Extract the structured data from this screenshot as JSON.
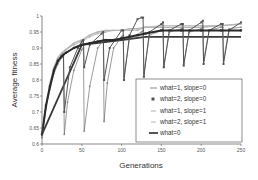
{
  "chart_data": {
    "type": "line",
    "title": "",
    "xlabel": "Generations",
    "ylabel": "Average fitness",
    "xlim": [
      0,
      250
    ],
    "ylim": [
      0.6,
      1.0
    ],
    "xticks": [
      0,
      50,
      100,
      150,
      200,
      250
    ],
    "xtick_labels": [
      "0",
      "50",
      "100",
      "150",
      "200",
      "250"
    ],
    "yticks": [
      0.6,
      0.65,
      0.7,
      0.75,
      0.8,
      0.85,
      0.9,
      0.95,
      1.0
    ],
    "ytick_labels": [
      "0.6",
      "0.65",
      "0.7",
      "0.75",
      "0.8",
      "0.85",
      "0.9",
      "0.95",
      "1"
    ],
    "grid": false,
    "legend_position": "lower right",
    "series": [
      {
        "name": "what=1, slope=0",
        "color": "#6e6e6e",
        "marker": "plus",
        "x": [
          0,
          5,
          10,
          15,
          20,
          25,
          27,
          28,
          32,
          40,
          50,
          52,
          53,
          60,
          70,
          77,
          78,
          82,
          90,
          100,
          102,
          103,
          110,
          125,
          127,
          128,
          135,
          150,
          152,
          153,
          160,
          175,
          177,
          178,
          185,
          200,
          202,
          203,
          210,
          225,
          227,
          228,
          235,
          250
        ],
        "y": [
          0.62,
          0.71,
          0.77,
          0.82,
          0.85,
          0.87,
          0.875,
          0.63,
          0.73,
          0.83,
          0.895,
          0.9,
          0.64,
          0.78,
          0.9,
          0.925,
          0.67,
          0.79,
          0.9,
          0.935,
          0.94,
          0.81,
          0.93,
          0.95,
          0.955,
          0.82,
          0.94,
          0.955,
          0.96,
          0.84,
          0.95,
          0.96,
          0.96,
          0.85,
          0.95,
          0.96,
          0.965,
          0.86,
          0.955,
          0.965,
          0.965,
          0.86,
          0.96,
          0.965
        ]
      },
      {
        "name": "what=2, slope=0",
        "color": "#555555",
        "marker": "square",
        "x": [
          0,
          5,
          10,
          15,
          20,
          25,
          27,
          28,
          35,
          45,
          50,
          52,
          53,
          60,
          75,
          77,
          78,
          85,
          100,
          102,
          103,
          110,
          120,
          125,
          127,
          128,
          135,
          150,
          152,
          153,
          160,
          175,
          177,
          178,
          185,
          200,
          202,
          203,
          210,
          225,
          227,
          228,
          235,
          250
        ],
        "y": [
          0.63,
          0.72,
          0.78,
          0.83,
          0.86,
          0.875,
          0.88,
          0.7,
          0.84,
          0.9,
          0.92,
          0.925,
          0.84,
          0.91,
          0.945,
          0.95,
          0.8,
          0.9,
          0.955,
          0.955,
          0.8,
          0.94,
          0.99,
          0.995,
          0.995,
          0.81,
          0.95,
          0.975,
          0.98,
          0.84,
          0.955,
          0.975,
          0.975,
          0.845,
          0.955,
          0.98,
          0.985,
          0.85,
          0.955,
          0.975,
          0.975,
          0.85,
          0.955,
          0.98
        ]
      },
      {
        "name": "what=1, slope=1",
        "color": "#a0a0a0",
        "marker": "plus",
        "x": [
          0,
          5,
          10,
          15,
          20,
          25,
          30,
          40,
          50,
          60,
          70,
          80,
          90,
          100,
          110,
          120,
          130,
          150,
          175,
          200,
          225,
          250
        ],
        "y": [
          0.63,
          0.72,
          0.78,
          0.83,
          0.86,
          0.88,
          0.895,
          0.91,
          0.92,
          0.935,
          0.945,
          0.95,
          0.955,
          0.955,
          0.955,
          0.955,
          0.965,
          0.97,
          0.97,
          0.97,
          0.97,
          0.975
        ]
      },
      {
        "name": "what=2, slope=1",
        "color": "#b5b5b5",
        "marker": "dash",
        "x": [
          0,
          5,
          10,
          15,
          20,
          25,
          30,
          40,
          50,
          60,
          70,
          80,
          90,
          100,
          110,
          120,
          130,
          150,
          175,
          200,
          225,
          250
        ],
        "y": [
          0.63,
          0.72,
          0.79,
          0.84,
          0.87,
          0.885,
          0.895,
          0.915,
          0.925,
          0.94,
          0.95,
          0.955,
          0.955,
          0.955,
          0.96,
          0.96,
          0.965,
          0.965,
          0.965,
          0.965,
          0.97,
          0.975
        ]
      },
      {
        "name": "what=0",
        "color": "#2a2a2a",
        "marker": "square-bold",
        "x": [
          0,
          5,
          10,
          15,
          20,
          25,
          30,
          40,
          50,
          60,
          70,
          80,
          90,
          100,
          110,
          120,
          130,
          150,
          175,
          200,
          225,
          250
        ],
        "y": [
          0.63,
          0.72,
          0.78,
          0.83,
          0.86,
          0.875,
          0.885,
          0.9,
          0.91,
          0.915,
          0.92,
          0.925,
          0.925,
          0.93,
          0.935,
          0.94,
          0.945,
          0.955,
          0.955,
          0.955,
          0.955,
          0.955
        ]
      }
    ],
    "extra_line": {
      "name": "what=0 (lower plateau)",
      "x": [
        0,
        50,
        100,
        130,
        150,
        200,
        250
      ],
      "y": [
        0.63,
        0.91,
        0.925,
        0.935,
        0.935,
        0.935,
        0.935
      ]
    }
  },
  "legend": {
    "items": [
      {
        "label": "what=1, slope=0"
      },
      {
        "label": "what=2, slope=0"
      },
      {
        "label": "what=1, slope=1"
      },
      {
        "label": "what=2, slope=1"
      },
      {
        "label": "what=0"
      }
    ]
  },
  "axes": {
    "xlabel": "Generations",
    "ylabel": "Average fitness"
  }
}
